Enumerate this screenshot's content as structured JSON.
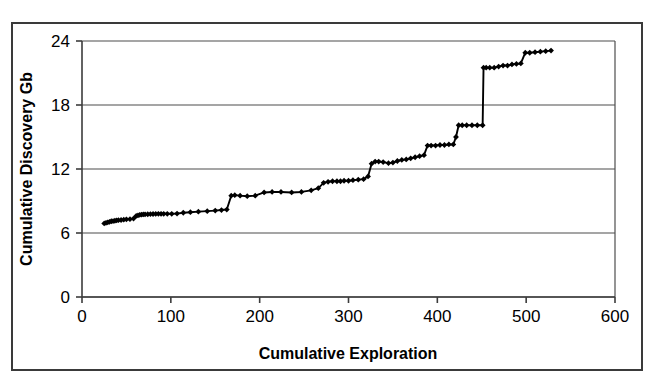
{
  "figure": {
    "background_color": "#ffffff",
    "frame_color": "#3a3a3a",
    "series_color": "#000000",
    "gridline_color": "#4d4d4d"
  },
  "chart_data": {
    "type": "line",
    "title": "",
    "subtitle": "",
    "xlabel": "Cumulative Exploration",
    "ylabel": "Cumulative Discovery Gb",
    "xlim": [
      0,
      600
    ],
    "ylim": [
      0,
      24
    ],
    "xticks": [
      0,
      100,
      200,
      300,
      400,
      500,
      600
    ],
    "yticks": [
      0,
      6,
      12,
      18,
      24
    ],
    "xtick_labels": [
      "0",
      "100",
      "200",
      "300",
      "400",
      "500",
      "600"
    ],
    "ytick_labels": [
      "0",
      "6",
      "12",
      "18",
      "24"
    ],
    "grid": "horizontal",
    "legend": "none",
    "marker": "diamond",
    "series": [
      {
        "name": "Cumulative discovery",
        "x": [
          25,
          27,
          29,
          31,
          33,
          35,
          37,
          39,
          41,
          44,
          47,
          50,
          54,
          58,
          61,
          63,
          65,
          67,
          69,
          71,
          74,
          77,
          80,
          83,
          86,
          89,
          92,
          96,
          101,
          107,
          114,
          122,
          131,
          141,
          150,
          157,
          163,
          168,
          172,
          178,
          186,
          195,
          205,
          214,
          224,
          236,
          247,
          258,
          266,
          272,
          277,
          282,
          287,
          291,
          295,
          300,
          305,
          311,
          317,
          322,
          326,
          330,
          334,
          339,
          345,
          350,
          355,
          360,
          365,
          370,
          375,
          380,
          385,
          389,
          393,
          398,
          403,
          408,
          413,
          418,
          421,
          424,
          428,
          433,
          439,
          445,
          451,
          452,
          455,
          459,
          464,
          469,
          474,
          479,
          484,
          489,
          494,
          499,
          504,
          510,
          516,
          522,
          528
        ],
        "y": [
          6.9,
          6.95,
          7.0,
          7.05,
          7.1,
          7.12,
          7.15,
          7.18,
          7.2,
          7.22,
          7.25,
          7.28,
          7.3,
          7.35,
          7.6,
          7.65,
          7.7,
          7.72,
          7.74,
          7.75,
          7.76,
          7.77,
          7.78,
          7.79,
          7.8,
          7.8,
          7.8,
          7.8,
          7.8,
          7.82,
          7.9,
          7.95,
          8.0,
          8.05,
          8.1,
          8.15,
          8.2,
          9.5,
          9.55,
          9.5,
          9.45,
          9.5,
          9.8,
          9.85,
          9.85,
          9.8,
          9.85,
          10.0,
          10.2,
          10.7,
          10.8,
          10.85,
          10.85,
          10.85,
          10.9,
          10.9,
          10.95,
          11.0,
          11.05,
          11.3,
          12.5,
          12.7,
          12.7,
          12.65,
          12.55,
          12.6,
          12.75,
          12.85,
          12.9,
          13.0,
          13.1,
          13.2,
          13.3,
          14.2,
          14.2,
          14.2,
          14.25,
          14.25,
          14.3,
          14.3,
          15.0,
          16.1,
          16.1,
          16.1,
          16.1,
          16.1,
          16.1,
          21.5,
          21.5,
          21.5,
          21.5,
          21.6,
          21.7,
          21.7,
          21.8,
          21.85,
          21.9,
          22.9,
          22.9,
          22.95,
          23.0,
          23.05,
          23.1
        ]
      }
    ]
  }
}
